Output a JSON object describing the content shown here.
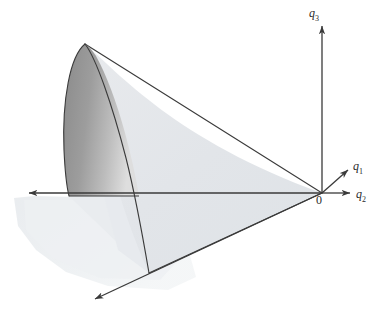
{
  "figure": {
    "kind": "3d-geometry-diagram",
    "background_color": "#ffffff"
  },
  "axes": {
    "origin": {
      "label": "0",
      "x": 322,
      "y": 193,
      "label_x": 317,
      "label_y": 195
    },
    "items": [
      {
        "name": "q3",
        "base": "q",
        "subscript": "3",
        "direction": "up",
        "line": {
          "x1": 322,
          "y1": 193,
          "x2": 322,
          "y2": 26
        },
        "arrow": true,
        "label_x": 309,
        "label_y": 6
      },
      {
        "name": "q1",
        "base": "q",
        "subscript": "1",
        "direction": "up-right",
        "line": {
          "x1": 322,
          "y1": 193,
          "x2": 349,
          "y2": 169
        },
        "arrow": true,
        "label_x": 353,
        "label_y": 159
      },
      {
        "name": "q2",
        "base": "q",
        "subscript": "2",
        "direction": "right",
        "line": {
          "x1": 322,
          "y1": 193,
          "x2": 351,
          "y2": 193
        },
        "arrow": true,
        "label_x": 356,
        "label_y": 189
      },
      {
        "name": "q2-negative",
        "base": "",
        "subscript": "",
        "direction": "left",
        "line": {
          "x1": 322,
          "y1": 193,
          "x2": 27,
          "y2": 193
        },
        "arrow": true,
        "label_x": null,
        "label_y": null
      },
      {
        "name": "q1-negative",
        "base": "",
        "subscript": "",
        "direction": "down-left",
        "line": {
          "x1": 322,
          "y1": 193,
          "x2": 93,
          "y2": 300
        },
        "arrow": true,
        "label_x": null,
        "label_y": null
      }
    ]
  },
  "colors": {
    "stroke": "#3a3a3a",
    "cone_light": "#e4e7ea",
    "cone_light_edge": "#d6dade",
    "inner_lobe_dark": "#8d8d8d",
    "inner_lobe_light": "#d9d9d9",
    "ground_shadow": "#eceff1",
    "text": "#2b2b2b"
  },
  "geometry": {
    "apex": {
      "x": 85,
      "y": 44
    },
    "cone_right_edge_end": {
      "x": 322,
      "y": 193
    },
    "base_curve_left": {
      "x": 69,
      "y": 196
    },
    "base_curve_bottom": {
      "x": 149,
      "y": 273
    },
    "notes": "Elliptic cone with vertex at upper-left apex, opening down-right to the origin; near lobe shaded darker."
  }
}
